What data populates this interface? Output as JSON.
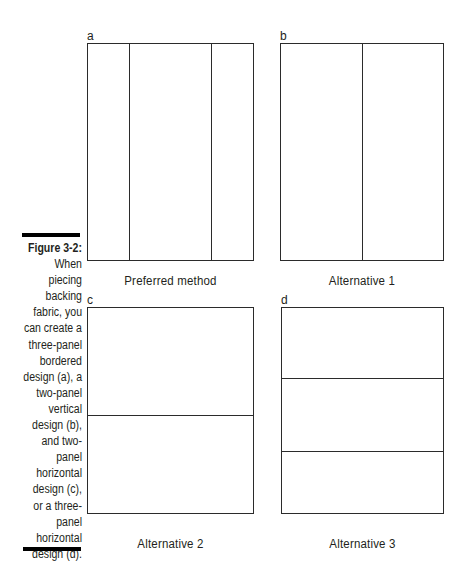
{
  "figure": {
    "title": "Figure 3-2:",
    "caption_lines": [
      "When",
      "piecing",
      "backing",
      "fabric, you",
      "can create a",
      "three-panel",
      "bordered",
      "design (a), a",
      "two-panel",
      "vertical",
      "design (b),",
      "and two-",
      "panel",
      "horizontal",
      "design (c),",
      "or a three-",
      "panel",
      "horizontal",
      "design (d)."
    ]
  },
  "panels": [
    {
      "id": "a",
      "label": "a",
      "caption": "Preferred method",
      "layout": "three-panel bordered (vertical strips: narrow, wide, narrow)"
    },
    {
      "id": "b",
      "label": "b",
      "caption": "Alternative 1",
      "layout": "two-panel vertical"
    },
    {
      "id": "c",
      "label": "c",
      "caption": "Alternative 2",
      "layout": "two-panel horizontal"
    },
    {
      "id": "d",
      "label": "d",
      "caption": "Alternative 3",
      "layout": "three-panel horizontal"
    }
  ],
  "colors": {
    "line": "#2b2b2b",
    "text": "#231f20",
    "bar": "#000000",
    "background": "#ffffff"
  }
}
